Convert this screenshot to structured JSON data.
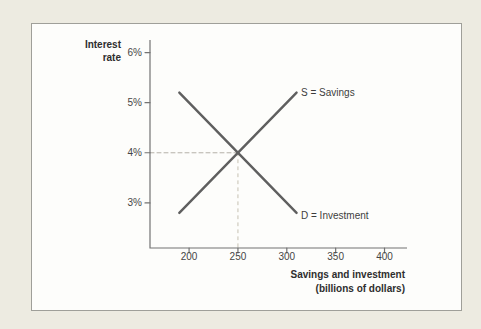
{
  "colors": {
    "page_bg": "#edebe1",
    "panel_bg": "#fdfdfb",
    "panel_border": "#9f9f99",
    "axis": "#737373",
    "curve": "#5f5f5f",
    "dash_horizontal": "#b4b1a8",
    "dash_vertical": "#c6c1b2",
    "text": "#2e2e2e",
    "tick_text": "#454545",
    "series_text": "#3d3d3d"
  },
  "chart_data": {
    "type": "line",
    "title": "",
    "ylabel": "Interest rate",
    "ylabel_lines": [
      "Interest",
      "rate"
    ],
    "xlabel": "Savings and investment (billions of dollars)",
    "xlabel_lines": [
      "Savings and investment",
      "(billions of dollars)"
    ],
    "xlim": [
      160,
      423
    ],
    "ylim": [
      2.1,
      6.25
    ],
    "x_ticks": [
      {
        "value": 200,
        "label": "200"
      },
      {
        "value": 250,
        "label": "250"
      },
      {
        "value": 300,
        "label": "300"
      },
      {
        "value": 350,
        "label": "350"
      },
      {
        "value": 400,
        "label": "400"
      }
    ],
    "y_ticks": [
      {
        "value": 3,
        "label": "3%"
      },
      {
        "value": 4,
        "label": "4%"
      },
      {
        "value": 5,
        "label": "5%"
      },
      {
        "value": 6,
        "label": "6%"
      }
    ],
    "series": [
      {
        "name": "S = Savings",
        "points": [
          [
            190,
            2.8
          ],
          [
            310,
            5.2
          ]
        ]
      },
      {
        "name": "D = Investment",
        "points": [
          [
            190,
            5.2
          ],
          [
            310,
            2.8
          ]
        ]
      }
    ],
    "equilibrium": {
      "x": 250,
      "y": 4,
      "note": "dashed guide lines mark equilibrium at 250 billion dollars and 4% interest rate"
    },
    "grid": false,
    "legend_position": "inline labels at line ends"
  }
}
